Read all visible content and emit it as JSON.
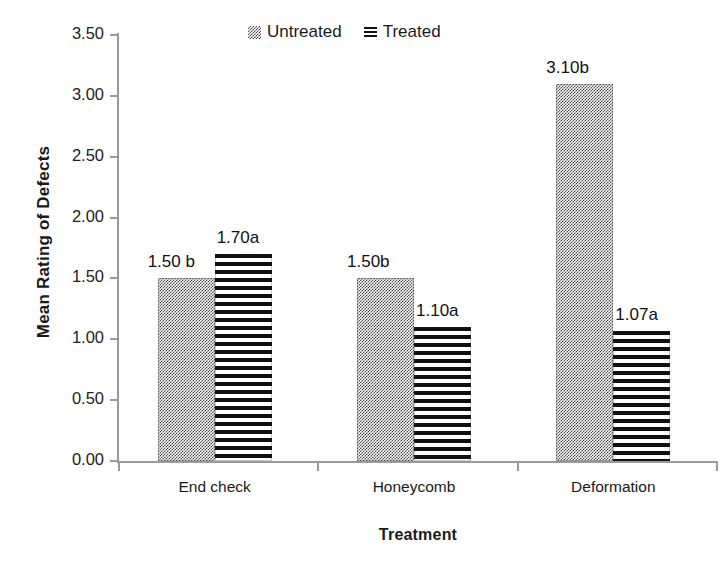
{
  "chart_data": {
    "type": "bar",
    "title": "",
    "xlabel": "Treatment",
    "ylabel": "Mean Rating of Defects",
    "categories": [
      "End check",
      "Honeycomb",
      "Deformation"
    ],
    "ylim": [
      0.0,
      3.5
    ],
    "ytick_labels": [
      "0.00",
      "0.50",
      "1.00",
      "1.50",
      "2.00",
      "2.50",
      "3.00",
      "3.50"
    ],
    "ytick_values": [
      0.0,
      0.5,
      1.0,
      1.5,
      2.0,
      2.5,
      3.0,
      3.5
    ],
    "grid": false,
    "legend_position": "top-center",
    "series": [
      {
        "name": "Untreated",
        "pattern": "checkered-dots",
        "color": "#4a4a4a",
        "values": [
          1.5,
          1.5,
          3.1
        ],
        "data_labels": [
          "1.50 b",
          "1.50b",
          "3.10b"
        ]
      },
      {
        "name": "Treated",
        "pattern": "horizontal-stripes",
        "color": "#101010",
        "values": [
          1.7,
          1.1,
          1.07
        ],
        "data_labels": [
          "1.70a",
          "1.10a",
          "1.07a"
        ]
      }
    ]
  },
  "legend": {
    "items": [
      {
        "label": "Untreated",
        "swatch": "checkered-swatch-icon"
      },
      {
        "label": "Treated",
        "swatch": "striped-swatch-icon"
      }
    ]
  },
  "axes": {
    "y_title": "Mean Rating of Defects",
    "x_title": "Treatment"
  }
}
